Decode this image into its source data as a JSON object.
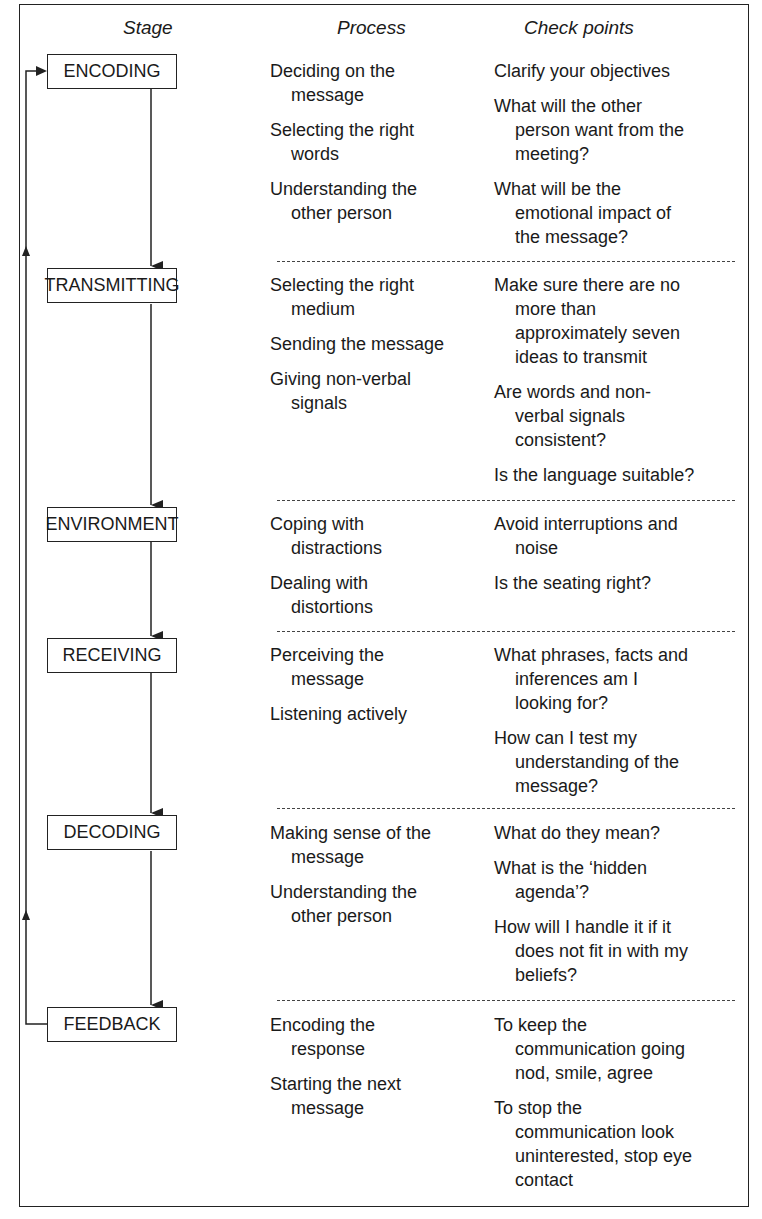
{
  "headers": {
    "stage": "Stage",
    "process": "Process",
    "checkpoints": "Check points"
  },
  "stages": [
    {
      "name": "ENCODING",
      "process": [
        [
          "Deciding on the",
          "message"
        ],
        [
          "Selecting the right",
          "words"
        ],
        [
          "Understanding the",
          "other person"
        ]
      ],
      "checkpoints": [
        [
          "Clarify your objectives"
        ],
        [
          "What will the other",
          "person want from the",
          "meeting?"
        ],
        [
          "What will be the",
          "emotional impact of",
          "the message?"
        ]
      ]
    },
    {
      "name": "TRANSMITTING",
      "process": [
        [
          "Selecting the right",
          "medium"
        ],
        [
          "Sending the message"
        ],
        [
          "Giving non-verbal",
          "signals"
        ]
      ],
      "checkpoints": [
        [
          "Make sure there are no",
          "more than",
          "approximately seven",
          "ideas to transmit"
        ],
        [
          "Are words and non-",
          "verbal signals",
          "consistent?"
        ],
        [
          "Is the language suitable?"
        ]
      ]
    },
    {
      "name": "ENVIRONMENT",
      "process": [
        [
          "Coping with",
          "distractions"
        ],
        [
          "Dealing with",
          "distortions"
        ]
      ],
      "checkpoints": [
        [
          "Avoid interruptions and",
          "noise"
        ],
        [
          "Is the seating right?"
        ]
      ]
    },
    {
      "name": "RECEIVING",
      "process": [
        [
          "Perceiving the",
          "message"
        ],
        [
          "Listening actively"
        ]
      ],
      "checkpoints": [
        [
          "What phrases, facts and",
          "inferences am I",
          "looking for?"
        ],
        [
          "How can I test my",
          "understanding of the",
          "message?"
        ]
      ]
    },
    {
      "name": "DECODING",
      "process": [
        [
          "Making sense of the",
          "message"
        ],
        [
          "Understanding the",
          "other person"
        ]
      ],
      "checkpoints": [
        [
          "What do they mean?"
        ],
        [
          "What is the ‘hidden",
          "agenda’?"
        ],
        [
          "How will I handle it if it",
          "does not fit in with my",
          "beliefs?"
        ]
      ]
    },
    {
      "name": "FEEDBACK",
      "process": [
        [
          "Encoding the",
          "response"
        ],
        [
          "Starting the next",
          "message"
        ]
      ],
      "checkpoints": [
        [
          "To keep the",
          "communication going",
          "nod, smile, agree"
        ],
        [
          "To stop the",
          "communication look",
          "uninterested, stop eye",
          "contact"
        ]
      ]
    }
  ]
}
